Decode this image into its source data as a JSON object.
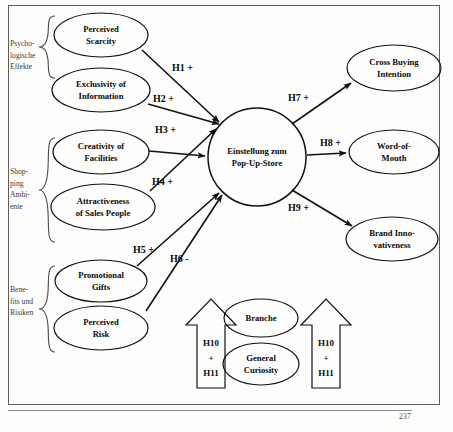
{
  "page": {
    "page_number": "237"
  },
  "groups": [
    {
      "id": "psychologische-effekte",
      "lines": [
        "Psycho-",
        "logische",
        "Effekte"
      ]
    },
    {
      "id": "shopping-ambiente",
      "lines": [
        "Shop-",
        "ping",
        "Ambi-",
        "ente"
      ]
    },
    {
      "id": "benefits-und-risiken",
      "lines": [
        "Bene-",
        "fits und",
        "Risiken"
      ]
    }
  ],
  "nodes": {
    "perceived_scarcity": {
      "lines": [
        "Perceived",
        "Scarcity"
      ]
    },
    "exclusivity_of_information": {
      "lines": [
        "Exclusivity of",
        "Information"
      ]
    },
    "creativity_of_facilities": {
      "lines": [
        "Creativity of",
        "Facilities"
      ]
    },
    "attractiveness_of_sales_people": {
      "lines": [
        "Attractiveness",
        "of Sales People"
      ]
    },
    "promotional_gifts": {
      "lines": [
        "Promotional",
        "Gifts"
      ]
    },
    "perceived_risk": {
      "lines": [
        "Perceived",
        "Risk"
      ]
    },
    "central_construct": {
      "lines": [
        "Einstellung zum",
        "Pop-Up-Store"
      ]
    },
    "cross_buying_intention": {
      "lines": [
        "Cross Buying",
        "Intention"
      ]
    },
    "word_of_mouth": {
      "lines": [
        "Word-of-",
        "Mouth"
      ]
    },
    "brand_innovativeness": {
      "lines": [
        "Brand Inno-",
        "vativeness"
      ]
    },
    "branche": {
      "lines": [
        "Branche"
      ]
    },
    "general_curiosity": {
      "lines": [
        "General",
        "Curiosity"
      ]
    }
  },
  "hypotheses": {
    "h1": "H1 +",
    "h2": "H2 +",
    "h3": "H3  +",
    "h4": "H4 +",
    "h5": "H5 +",
    "h6": "H6 -",
    "h7": "H7 +",
    "h8": "H8 +",
    "h9": "H9 +",
    "moderator_left": [
      "H10",
      "+",
      "H11"
    ],
    "moderator_right": [
      "H10",
      "+",
      "H11"
    ]
  },
  "colors": {
    "line": "#111111",
    "frame": "#5d5d5d",
    "background": "#fdfdfb",
    "text": "#0a0a0a",
    "brace_text": "#3a3a3a"
  }
}
